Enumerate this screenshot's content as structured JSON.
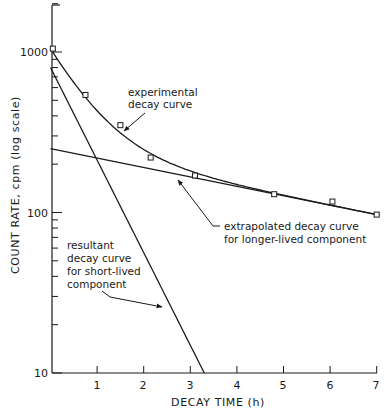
{
  "chart_data": {
    "type": "line",
    "title": "",
    "xlabel": "DECAY TIME (h)",
    "ylabel": "COUNT RATE, cpm (log scale)",
    "xlim": [
      0,
      7
    ],
    "ylim": [
      10,
      2000
    ],
    "yscale": "log",
    "grid": false,
    "legend": null,
    "x_ticks": [
      "1",
      "2",
      "3",
      "4",
      "5",
      "6",
      "7"
    ],
    "y_ticks": [
      "10",
      "100",
      "1000"
    ],
    "series": [
      {
        "name": "experimental decay curve",
        "kind": "data points with smooth fitted curve",
        "marker": "square",
        "x": [
          0.05,
          0.75,
          1.5,
          2.15,
          3.1,
          4.8,
          6.05,
          7.0
        ],
        "y": [
          1050,
          540,
          350,
          220,
          170,
          130,
          117,
          97
        ]
      },
      {
        "name": "extrapolated decay curve for longer-lived component",
        "kind": "straight line (log scale)",
        "x": [
          0,
          7
        ],
        "y": [
          250,
          97
        ]
      },
      {
        "name": "resultant decay curve for short-lived component",
        "kind": "straight line (log scale)",
        "x": [
          0,
          3.3
        ],
        "y": [
          800,
          10
        ]
      }
    ],
    "annotations": [
      {
        "text": [
          "experimental",
          "decay curve"
        ],
        "points_to": "experimental decay curve"
      },
      {
        "text": [
          "extrapolated decay curve",
          "for longer-lived component"
        ],
        "points_to": "extrapolated line"
      },
      {
        "text": [
          "resultant",
          "decay curve",
          "for short-lived",
          "component"
        ],
        "points_to": "short-lived line"
      }
    ]
  },
  "labels": {
    "xlabel": "DECAY TIME (h)",
    "ylabel": "COUNT RATE, cpm (log scale)",
    "y_tick_10": "10",
    "y_tick_100": "100",
    "y_tick_1000": "1000",
    "x_tick_1": "1",
    "x_tick_2": "2",
    "x_tick_3": "3",
    "x_tick_4": "4",
    "x_tick_5": "5",
    "x_tick_6": "6",
    "x_tick_7": "7",
    "annot_exp_1": "experimental",
    "annot_exp_2": "decay curve",
    "annot_ext_1": "extrapolated decay curve",
    "annot_ext_2": "for longer-lived component",
    "annot_short_1": "resultant",
    "annot_short_2": "decay curve",
    "annot_short_3": "for short-lived",
    "annot_short_4": "component"
  },
  "colors": {
    "ink": "#1a1a1a",
    "background": "#ffffff"
  }
}
